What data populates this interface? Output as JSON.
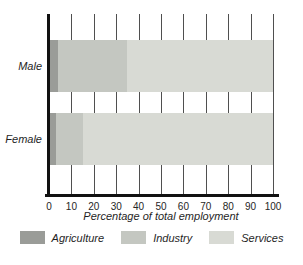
{
  "chart_data": {
    "type": "bar",
    "orientation": "horizontal",
    "stacked": true,
    "title": "",
    "xlabel": "Percentage of total employment",
    "ylabel": "",
    "categories": [
      "Male",
      "Female"
    ],
    "series": [
      {
        "name": "Agriculture",
        "color": "#9a9c98",
        "values": [
          4,
          3
        ]
      },
      {
        "name": "Industry",
        "color": "#c4c7c1",
        "values": [
          31,
          12
        ]
      },
      {
        "name": "Services",
        "color": "#d8dad4",
        "values": [
          65,
          85
        ]
      }
    ],
    "xlim": [
      0,
      100
    ],
    "xticks": [
      0,
      10,
      20,
      30,
      40,
      50,
      60,
      70,
      80,
      90,
      100
    ],
    "grid": true,
    "legend_position": "bottom",
    "axis_color": "#111111",
    "gridline_color": "#4f4f4f"
  },
  "layout": {
    "row_tops_px": [
      26,
      99
    ],
    "row_height_px": 52
  }
}
